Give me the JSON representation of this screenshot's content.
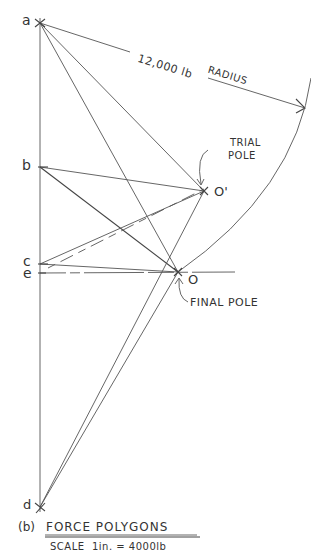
{
  "diagram": {
    "type": "force-polygon",
    "caption": {
      "prefix": "(b)",
      "title": "FORCE POLYGONS",
      "scale": "SCALE  1in. = 4000lb"
    },
    "points": {
      "a": {
        "label": "a",
        "x": 40,
        "y": 23
      },
      "b": {
        "label": "b",
        "x": 40,
        "y": 167
      },
      "c": {
        "label": "c",
        "x": 40,
        "y": 264
      },
      "e": {
        "label": "e",
        "x": 40,
        "y": 273
      },
      "d": {
        "label": "d",
        "x": 40,
        "y": 507
      },
      "O": {
        "label": "O",
        "x": 178,
        "y": 272
      },
      "O_prime": {
        "label": "O'",
        "x": 204,
        "y": 191
      }
    },
    "annotations": {
      "radius": "12,000 lb  RADIUS",
      "radius_num": "12,000 lb",
      "radius_word": "RADIUS",
      "trial_pole_line1": "TRIAL",
      "trial_pole_line2": "POLE",
      "final_pole": "FINAL POLE"
    }
  }
}
